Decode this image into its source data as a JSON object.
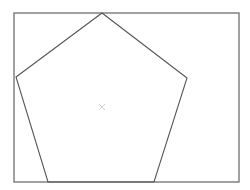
{
  "diagram": {
    "background": "#ffffff",
    "frame": {
      "x": 14,
      "y": 13,
      "width": 225,
      "height": 169,
      "stroke": "#7a7a7a",
      "stroke_width": 1.4
    },
    "pentagon": {
      "points": "102,13 187,78 154,182 48,182 16,77",
      "stroke": "#555555",
      "stroke_width": 1.1,
      "fill": "none"
    },
    "center_mark": {
      "x": 102,
      "y": 107,
      "size": 3,
      "stroke": "#d0d0d0",
      "symbol": "cross-mark"
    }
  }
}
